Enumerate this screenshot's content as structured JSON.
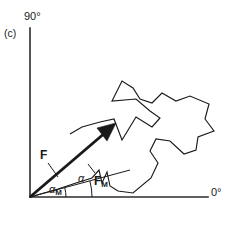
{
  "figure": {
    "panel_label": "(c)",
    "axes": {
      "y_axis_label": "90°",
      "x_axis_label": "0°",
      "origin": [
        30,
        197
      ],
      "y_top": 28,
      "x_right": 208
    },
    "annotations": {
      "force_label": "F",
      "mean_force_label": "F",
      "mean_force_sub": "M",
      "angle_label": "α",
      "mean_angle_label": "α",
      "mean_angle_sub": "M"
    },
    "colors": {
      "ink": "#1a1a1a",
      "background": "#ffffff",
      "axis": "#2b2b2b"
    }
  },
  "chart_data": {
    "type": "line",
    "title": "",
    "xlabel": "0°",
    "ylabel": "90°",
    "grid": false,
    "legend": "none",
    "xlim": [
      30,
      208
    ],
    "ylim": [
      197,
      28
    ],
    "series": [
      {
        "name": "random-walk-path",
        "description": "Irregular random-walk trajectory of successive force vectors",
        "points": [
          [
            30,
            197
          ],
          [
            58,
            189
          ],
          [
            76,
            183
          ],
          [
            92,
            178
          ],
          [
            99,
            170
          ],
          [
            102,
            183
          ],
          [
            107,
            172
          ],
          [
            110,
            186
          ],
          [
            118,
            191
          ],
          [
            133,
            193
          ],
          [
            151,
            178
          ],
          [
            158,
            163
          ],
          [
            150,
            151
          ],
          [
            156,
            139
          ],
          [
            170,
            141
          ],
          [
            184,
            154
          ],
          [
            196,
            150
          ],
          [
            198,
            137
          ],
          [
            214,
            131
          ],
          [
            205,
            119
          ],
          [
            209,
            104
          ],
          [
            190,
            96
          ],
          [
            176,
            101
          ],
          [
            162,
            93
          ],
          [
            152,
            103
          ],
          [
            140,
            99
          ],
          [
            133,
            88
          ],
          [
            122,
            81
          ],
          [
            112,
            101
          ],
          [
            136,
            99
          ],
          [
            150,
            111
          ],
          [
            160,
            118
          ],
          [
            152,
            127
          ],
          [
            136,
            117
          ],
          [
            122,
            140
          ],
          [
            114,
            119
          ],
          [
            100,
            122
          ],
          [
            82,
            127
          ],
          [
            70,
            134
          ]
        ]
      },
      {
        "name": "resultant-force-vector-F",
        "description": "Thick arrow from origin to resultant, the vector sum F",
        "points": [
          [
            30,
            197
          ],
          [
            112,
            127
          ]
        ],
        "arrow": true
      },
      {
        "name": "mean-force-vector-FM",
        "description": "Thin line from origin along mean force direction",
        "points": [
          [
            30,
            197
          ],
          [
            130,
            170
          ]
        ]
      }
    ],
    "arcs": [
      {
        "name": "alpha-arc",
        "center": [
          30,
          197
        ],
        "radius": 62,
        "start_angle_deg": 0,
        "end_angle_deg": 15
      },
      {
        "name": "alpha-m-arc",
        "center": [
          30,
          197
        ],
        "radius": 36,
        "start_angle_deg": 0,
        "end_angle_deg": 15
      }
    ]
  }
}
